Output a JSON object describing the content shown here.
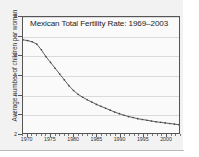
{
  "chart_data": {
    "type": "line",
    "title": "Mexican Total Fertility Rate: 1969–2003",
    "xlabel": "",
    "ylabel": "Average number of children per woman",
    "xlim": [
      1969,
      2003
    ],
    "ylim": [
      2,
      8
    ],
    "grid": true,
    "legend": "none",
    "marker": "point",
    "line_color": "#4a4a4a",
    "x": [
      1969,
      1970,
      1971,
      1972,
      1973,
      1974,
      1975,
      1976,
      1977,
      1978,
      1979,
      1980,
      1981,
      1982,
      1983,
      1984,
      1985,
      1986,
      1987,
      1988,
      1989,
      1990,
      1991,
      1992,
      1993,
      1994,
      1995,
      1996,
      1997,
      1998,
      1999,
      2000,
      2001,
      2002,
      2003
    ],
    "values": [
      6.82,
      6.78,
      6.72,
      6.6,
      6.3,
      5.95,
      5.65,
      5.35,
      5.05,
      4.75,
      4.45,
      4.2,
      4.0,
      3.85,
      3.72,
      3.6,
      3.48,
      3.38,
      3.28,
      3.18,
      3.08,
      3.0,
      2.92,
      2.85,
      2.8,
      2.74,
      2.7,
      2.66,
      2.62,
      2.58,
      2.55,
      2.52,
      2.49,
      2.46,
      2.43
    ],
    "ytick_labels": [
      "8",
      "7",
      "6",
      "5",
      "4",
      "3",
      "2"
    ],
    "ytick_values": [
      8,
      7,
      6,
      5,
      4,
      3,
      2
    ],
    "xtick_labels": [
      "1970",
      "1975",
      "1980",
      "1985",
      "1990",
      "1995",
      "2000"
    ],
    "xtick_values": [
      1970,
      1975,
      1980,
      1985,
      1990,
      1995,
      2000
    ]
  }
}
